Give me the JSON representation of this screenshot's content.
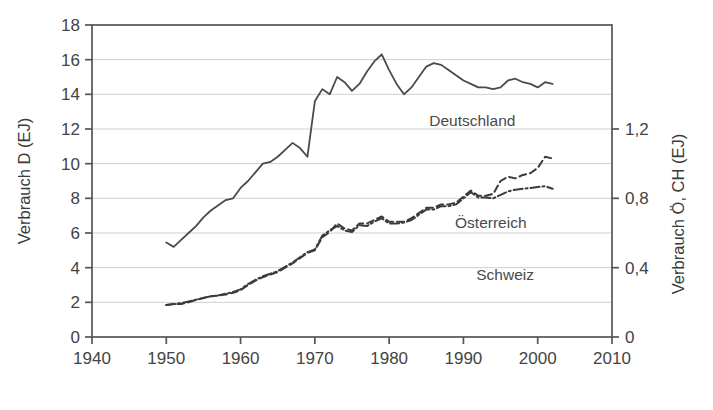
{
  "chart_data": {
    "type": "line",
    "title": "",
    "xlabel": "",
    "ylabel": "Verbrauch D (EJ)",
    "y2label": "Verbrauch Ö, CH (EJ)",
    "xlim": [
      1940,
      2010
    ],
    "ylim": [
      0,
      18
    ],
    "y2lim": [
      0,
      1.8
    ],
    "grid": true,
    "legend_position": "inline-annotations",
    "xticks": [
      1940,
      1950,
      1960,
      1970,
      1980,
      1990,
      2000,
      2010
    ],
    "xticklabels": [
      "1940",
      "1950",
      "1960",
      "1970",
      "1980",
      "1990",
      "2000",
      "2010"
    ],
    "yticks": [
      0,
      2,
      4,
      6,
      8,
      10,
      12,
      14,
      16,
      18
    ],
    "yticklabels": [
      "0",
      "2",
      "4",
      "6",
      "8",
      "10",
      "12",
      "14",
      "16",
      "18"
    ],
    "y2ticks": [
      0,
      0.4,
      0.8,
      1.2
    ],
    "y2ticklabels": [
      "0",
      "0,4",
      "0,8",
      "1,2"
    ],
    "series": [
      {
        "name": "Deutschland",
        "axis": "left",
        "style": "solid",
        "color": "#4a4a4a",
        "x": [
          1950,
          1951,
          1952,
          1953,
          1954,
          1955,
          1956,
          1957,
          1958,
          1959,
          1960,
          1961,
          1962,
          1963,
          1964,
          1965,
          1966,
          1967,
          1968,
          1969,
          1970,
          1971,
          1972,
          1973,
          1974,
          1975,
          1976,
          1977,
          1978,
          1979,
          1980,
          1981,
          1982,
          1983,
          1984,
          1985,
          1986,
          1987,
          1988,
          1989,
          1990,
          1991,
          1992,
          1993,
          1994,
          1995,
          1996,
          1997,
          1998,
          1999,
          2000,
          2001,
          2002
        ],
        "y": [
          5.45,
          5.2,
          5.6,
          6.0,
          6.4,
          6.9,
          7.3,
          7.6,
          7.9,
          8.0,
          8.6,
          9.0,
          9.5,
          10.0,
          10.1,
          10.4,
          10.8,
          11.2,
          10.9,
          10.4,
          13.6,
          14.3,
          14.0,
          15.0,
          14.7,
          14.2,
          14.6,
          15.3,
          15.9,
          16.3,
          15.4,
          14.6,
          14.0,
          14.4,
          15.0,
          15.6,
          15.8,
          15.7,
          15.4,
          15.1,
          14.8,
          14.6,
          14.4,
          14.4,
          14.3,
          14.4,
          14.8,
          14.9,
          14.7,
          14.6,
          14.4,
          14.7,
          14.6
        ]
      },
      {
        "name": "Österreich",
        "axis": "right",
        "style": "dashed",
        "color": "#3b3b3b",
        "x": [
          1950,
          1951,
          1952,
          1953,
          1954,
          1955,
          1956,
          1957,
          1958,
          1959,
          1960,
          1961,
          1962,
          1963,
          1964,
          1965,
          1966,
          1967,
          1968,
          1969,
          1970,
          1971,
          1972,
          1973,
          1974,
          1975,
          1976,
          1977,
          1978,
          1979,
          1980,
          1981,
          1982,
          1983,
          1984,
          1985,
          1986,
          1987,
          1988,
          1989,
          1990,
          1991,
          1992,
          1993,
          1994,
          1995,
          1996,
          1997,
          1998,
          1999,
          2000,
          2001,
          2002
        ],
        "y": [
          0.185,
          0.19,
          0.19,
          0.2,
          0.215,
          0.225,
          0.235,
          0.24,
          0.245,
          0.255,
          0.27,
          0.3,
          0.325,
          0.345,
          0.36,
          0.375,
          0.4,
          0.425,
          0.455,
          0.485,
          0.5,
          0.575,
          0.605,
          0.655,
          0.625,
          0.615,
          0.655,
          0.655,
          0.675,
          0.695,
          0.665,
          0.665,
          0.665,
          0.685,
          0.715,
          0.745,
          0.745,
          0.765,
          0.765,
          0.775,
          0.81,
          0.845,
          0.815,
          0.815,
          0.825,
          0.9,
          0.925,
          0.915,
          0.935,
          0.945,
          0.975,
          1.04,
          1.03
        ]
      },
      {
        "name": "Schweiz",
        "axis": "right",
        "style": "dashdot",
        "color": "#3b3b3b",
        "x": [
          1950,
          1951,
          1952,
          1953,
          1954,
          1955,
          1956,
          1957,
          1958,
          1959,
          1960,
          1961,
          1962,
          1963,
          1964,
          1965,
          1966,
          1967,
          1968,
          1969,
          1970,
          1971,
          1972,
          1973,
          1974,
          1975,
          1976,
          1977,
          1978,
          1979,
          1980,
          1981,
          1982,
          1983,
          1984,
          1985,
          1986,
          1987,
          1988,
          1989,
          1990,
          1991,
          1992,
          1993,
          1994,
          1995,
          1996,
          1997,
          1998,
          1999,
          2000,
          2001,
          2002
        ],
        "y": [
          0.185,
          0.19,
          0.195,
          0.205,
          0.215,
          0.225,
          0.235,
          0.24,
          0.25,
          0.26,
          0.275,
          0.305,
          0.33,
          0.35,
          0.365,
          0.38,
          0.405,
          0.43,
          0.46,
          0.49,
          0.505,
          0.585,
          0.615,
          0.64,
          0.615,
          0.605,
          0.645,
          0.64,
          0.665,
          0.685,
          0.655,
          0.655,
          0.66,
          0.675,
          0.705,
          0.735,
          0.735,
          0.755,
          0.755,
          0.765,
          0.8,
          0.835,
          0.805,
          0.805,
          0.8,
          0.82,
          0.84,
          0.85,
          0.855,
          0.86,
          0.865,
          0.87,
          0.855
        ]
      }
    ],
    "annotations": [
      {
        "text": "Deutschland",
        "x": 1997,
        "y": 12.2,
        "axis": "left"
      },
      {
        "text": "Österreich",
        "x": 1998.5,
        "y": 6.3,
        "axis": "left"
      },
      {
        "text": "Schweiz",
        "x": 1999.5,
        "y": 3.3,
        "axis": "left"
      }
    ]
  },
  "style": {
    "frame_color": "#555555",
    "grid_color": "#c9c9c9",
    "background": "#ffffff",
    "text_color": "#3f3f3f"
  }
}
